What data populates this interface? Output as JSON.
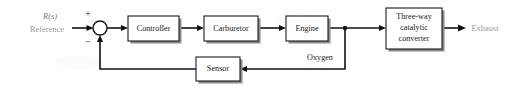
{
  "diagram": {
    "type": "control-block-diagram",
    "canvas": {
      "width": 514,
      "height": 91
    },
    "background_color": "#ffffff",
    "line_color": "#111111",
    "block_fill": "#ffffff",
    "block_stroke": "#1a1a1a",
    "block_shadow_color": "#8c8c8c",
    "gray_label_color": "#9a9a9a",
    "blocks": [
      {
        "id": "controller",
        "label": "Controller",
        "lines": [
          "Controller"
        ],
        "x": 128,
        "y": 16,
        "w": 51,
        "h": 25
      },
      {
        "id": "carburetor",
        "label": "Carburetor",
        "lines": [
          "Carburetor"
        ],
        "x": 204,
        "y": 16,
        "w": 54,
        "h": 25
      },
      {
        "id": "engine",
        "label": "Engine",
        "lines": [
          "Engine"
        ],
        "x": 286,
        "y": 16,
        "w": 42,
        "h": 25
      },
      {
        "id": "catalytic-converter",
        "label": "Three-way catalytic converter",
        "lines": [
          "Three-way",
          "catalytic",
          "converter"
        ],
        "x": 386,
        "y": 8,
        "w": 56,
        "h": 41
      },
      {
        "id": "sensor",
        "label": "Sensor",
        "lines": [
          "Sensor"
        ],
        "x": 196,
        "y": 57,
        "w": 44,
        "h": 24
      }
    ],
    "summing_junction": {
      "id": "summing-junction",
      "cx": 100,
      "cy": 28,
      "r": 7,
      "plus_sign": "+",
      "minus_sign": "−",
      "plus_pos": {
        "x": 88,
        "y": 15
      },
      "minus_pos": {
        "x": 88,
        "y": 42
      }
    },
    "junction_dot": {
      "x": 345,
      "y": 28,
      "r": 2.2
    },
    "signals": [
      {
        "id": "reference-input",
        "primary": "R(s)",
        "secondary": "Reference",
        "primary_style": "italic-serif",
        "color": "#9a9a9a",
        "x": 50,
        "primary_y": 17,
        "secondary_y": 30
      },
      {
        "id": "oxygen-feedback",
        "label": "Oxygen",
        "color": "#1a1a1a",
        "x": 320,
        "y": 58
      },
      {
        "id": "exhaust-output",
        "label": "Exhaust",
        "color": "#9a9a9a",
        "x": 482,
        "y": 29
      }
    ],
    "wires": [
      {
        "id": "wire-reference-to-sum",
        "from": "reference-input",
        "to": "summing-junction"
      },
      {
        "id": "wire-sum-to-controller",
        "from": "summing-junction",
        "to": "controller"
      },
      {
        "id": "wire-controller-to-carburetor",
        "from": "controller",
        "to": "carburetor"
      },
      {
        "id": "wire-carburetor-to-engine",
        "from": "carburetor",
        "to": "engine"
      },
      {
        "id": "wire-engine-to-converter",
        "from": "engine",
        "to": "catalytic-converter"
      },
      {
        "id": "wire-converter-to-exhaust",
        "from": "catalytic-converter",
        "to": "exhaust-output"
      },
      {
        "id": "wire-oxygen-branch-to-sensor",
        "from": "junction-dot",
        "to": "sensor"
      },
      {
        "id": "wire-sensor-to-sum",
        "from": "sensor",
        "to": "summing-junction"
      }
    ]
  }
}
